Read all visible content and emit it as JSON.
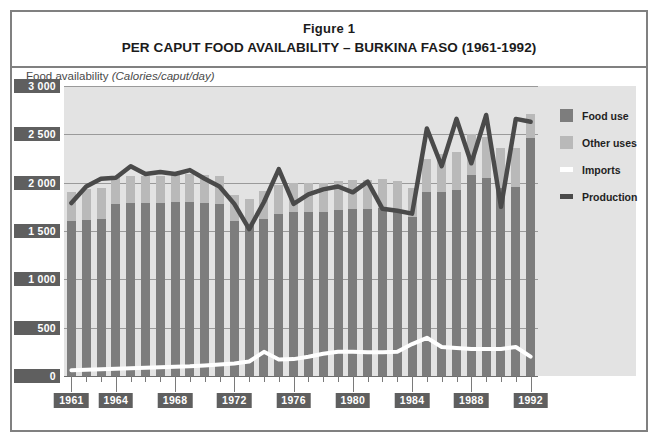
{
  "figure": {
    "label": "Figure 1",
    "title": "PER CAPUT FOOD AVAILABILITY – BURKINA FASO (1961-1992)"
  },
  "axis_caption": {
    "name": "Food availability",
    "units": "(Calories/caput/day)"
  },
  "legend": {
    "items": [
      {
        "label": "Food use",
        "type": "swatch",
        "color": "#7d7d7d"
      },
      {
        "label": "Other uses",
        "type": "swatch",
        "color": "#b9b9b9"
      },
      {
        "label": "Imports",
        "type": "line",
        "color": "#ffffff"
      },
      {
        "label": "Production",
        "type": "line",
        "color": "#4a4a4a"
      }
    ]
  },
  "colors": {
    "food_use": "#7d7d7d",
    "other_uses": "#b9b9b9",
    "imports": "#ffffff",
    "production": "#4a4a4a",
    "plot_background": "#e3e3e3",
    "gridline": "#9a9a9a",
    "tick_badge": "#5f5f5f",
    "frame": "#808080"
  },
  "chart_data": {
    "type": "bar",
    "title": "PER CAPUT FOOD AVAILABILITY – BURKINA FASO (1961-1992)",
    "subtitle": "Figure 1",
    "xlabel": "",
    "ylabel": "Food availability (Calories/caput/day)",
    "ylim": [
      0,
      3000
    ],
    "yticks": [
      0,
      500,
      1000,
      1500,
      2000,
      2500,
      3000
    ],
    "ytick_labels": [
      "0",
      "500",
      "1 000",
      "1 500",
      "2 000",
      "2 500",
      "3 000"
    ],
    "grid": true,
    "legend_position": "right",
    "stacked": true,
    "x": [
      1961,
      1962,
      1963,
      1964,
      1965,
      1966,
      1967,
      1968,
      1969,
      1970,
      1971,
      1972,
      1973,
      1974,
      1975,
      1976,
      1977,
      1978,
      1979,
      1980,
      1981,
      1982,
      1983,
      1984,
      1985,
      1986,
      1987,
      1988,
      1989,
      1990,
      1991,
      1992
    ],
    "xticks": [
      1961,
      1964,
      1968,
      1972,
      1976,
      1980,
      1984,
      1988,
      1992
    ],
    "xtick_labels": [
      "1961",
      "1964",
      "1968",
      "1972",
      "1976",
      "1980",
      "1984",
      "1988",
      "1992"
    ],
    "series": [
      {
        "name": "Food use",
        "kind": "bar-segment",
        "color": "#7d7d7d",
        "values": [
          1600,
          1610,
          1620,
          1780,
          1790,
          1790,
          1790,
          1800,
          1800,
          1790,
          1780,
          1600,
          1560,
          1620,
          1680,
          1700,
          1700,
          1700,
          1720,
          1730,
          1730,
          1740,
          1720,
          1640,
          1900,
          1900,
          1920,
          2080,
          2050,
          1940,
          1960,
          2460
        ]
      },
      {
        "name": "Other uses",
        "kind": "bar-segment",
        "color": "#b9b9b9",
        "values": [
          300,
          320,
          330,
          280,
          280,
          280,
          280,
          280,
          290,
          290,
          290,
          270,
          270,
          290,
          300,
          300,
          300,
          300,
          300,
          300,
          300,
          300,
          300,
          300,
          340,
          400,
          400,
          420,
          420,
          420,
          400,
          250
        ]
      },
      {
        "name": "Imports",
        "kind": "line",
        "color": "#ffffff",
        "values": [
          60,
          65,
          70,
          75,
          80,
          85,
          90,
          95,
          100,
          110,
          120,
          130,
          150,
          250,
          170,
          175,
          200,
          230,
          250,
          250,
          245,
          245,
          250,
          330,
          395,
          300,
          290,
          280,
          280,
          280,
          300,
          200
        ]
      },
      {
        "name": "Production",
        "kind": "line",
        "color": "#4a4a4a",
        "values": [
          1790,
          1960,
          2040,
          2050,
          2170,
          2090,
          2110,
          2090,
          2130,
          2040,
          1960,
          1780,
          1520,
          1800,
          2140,
          1780,
          1880,
          1930,
          1960,
          1900,
          2010,
          1730,
          1710,
          1680,
          2560,
          2170,
          2660,
          2200,
          2700,
          1750,
          2660,
          2630
        ]
      }
    ]
  }
}
